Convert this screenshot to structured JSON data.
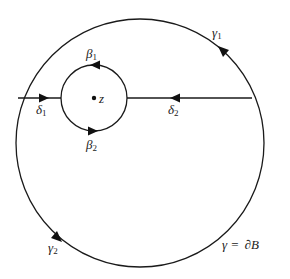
{
  "diagram": {
    "outer_circle": {
      "name": "gamma",
      "cx": 140,
      "cy": 143,
      "r": 124
    },
    "inner_circle": {
      "cx": 94,
      "cy": 98,
      "r": 33
    },
    "center_point": {
      "label": "z",
      "cx": 94,
      "cy": 98
    },
    "segments": [
      {
        "name": "delta1",
        "from": [
          17,
          98
        ],
        "to": [
          61,
          98
        ],
        "direction": "right"
      },
      {
        "name": "delta2",
        "from": [
          252,
          98
        ],
        "to": [
          127,
          98
        ],
        "direction": "left"
      }
    ],
    "labels": {
      "gamma1": {
        "base": "γ",
        "sub": "1"
      },
      "gamma2": {
        "base": "γ",
        "sub": "2"
      },
      "beta1": {
        "base": "β",
        "sub": "1"
      },
      "beta2": {
        "base": "β",
        "sub": "2"
      },
      "delta1": {
        "base": "δ",
        "sub": "1"
      },
      "delta2": {
        "base": "δ",
        "sub": "2"
      },
      "z": "z",
      "boundary": {
        "lhs": "γ",
        "eq": "=",
        "rhs": "∂B"
      }
    },
    "colors": {
      "line": "#1a1a1a",
      "background": "#ffffff"
    }
  }
}
